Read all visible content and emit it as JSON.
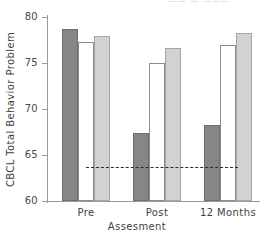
{
  "top_ghost_text": "——  —   ———",
  "chart_data": {
    "type": "bar",
    "title": "",
    "xlabel": "Assesment",
    "ylabel": "CBCL Total Behavior Problem",
    "categories": [
      "Pre",
      "Post",
      "12 Months"
    ],
    "ylim": [
      60,
      80
    ],
    "yticks": [
      60,
      65,
      70,
      75,
      80
    ],
    "ytick_labels": [
      "60",
      "65",
      "70",
      "75",
      "80"
    ],
    "grid": false,
    "legend": "none",
    "series": [
      {
        "name": "series-1",
        "color": "#868686",
        "values": [
          78.7,
          67.4,
          68.3
        ]
      },
      {
        "name": "series-2",
        "color": "#ffffff",
        "values": [
          77.3,
          75.0,
          77.0
        ]
      },
      {
        "name": "series-3",
        "color": "#d2d2d2",
        "values": [
          77.9,
          76.6,
          78.3
        ]
      }
    ],
    "reference_line": {
      "value": 63.7,
      "style": "dashed",
      "color": "#2b2b2b"
    }
  }
}
